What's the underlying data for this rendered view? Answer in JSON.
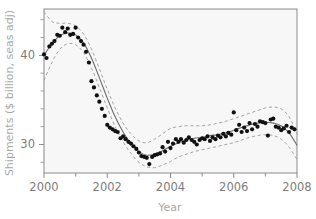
{
  "chart_data": {
    "type": "scatter",
    "title": "",
    "xlabel": "Year",
    "ylabel": "Shipments ($ billion, seas adj)",
    "xlim": [
      2000,
      2008
    ],
    "ylim": [
      26.8,
      45.2
    ],
    "grid": false,
    "legend": null,
    "xticks": [
      2000,
      2001,
      2002,
      2003,
      2004,
      2005,
      2006,
      2007,
      2008
    ],
    "xtick_labels": [
      "2000",
      "",
      "2002",
      "",
      "2004",
      "",
      "2006",
      "",
      "2008"
    ],
    "yticks": [
      28,
      30,
      32,
      34,
      36,
      38,
      40,
      42,
      44
    ],
    "ytick_labels": [
      "",
      "30",
      "",
      "",
      "",
      "",
      "40",
      "",
      ""
    ],
    "series": [
      {
        "name": "Observed shipments",
        "type": "scatter",
        "marker": "filled-circle",
        "color": "#111111",
        "x": [
          2000.0,
          2000.08,
          2000.17,
          2000.25,
          2000.33,
          2000.42,
          2000.5,
          2000.58,
          2000.67,
          2000.75,
          2000.83,
          2000.92,
          2001.0,
          2001.08,
          2001.17,
          2001.25,
          2001.33,
          2001.42,
          2001.5,
          2001.58,
          2001.67,
          2001.75,
          2001.83,
          2001.92,
          2002.0,
          2002.08,
          2002.17,
          2002.25,
          2002.33,
          2002.42,
          2002.5,
          2002.58,
          2002.67,
          2002.75,
          2002.83,
          2002.92,
          2003.0,
          2003.08,
          2003.17,
          2003.25,
          2003.33,
          2003.42,
          2003.5,
          2003.58,
          2003.67,
          2003.75,
          2003.83,
          2003.92,
          2004.0,
          2004.08,
          2004.17,
          2004.25,
          2004.33,
          2004.42,
          2004.5,
          2004.58,
          2004.67,
          2004.75,
          2004.83,
          2004.92,
          2005.0,
          2005.08,
          2005.17,
          2005.25,
          2005.33,
          2005.42,
          2005.5,
          2005.58,
          2005.67,
          2005.75,
          2005.83,
          2005.92,
          2006.0,
          2006.08,
          2006.17,
          2006.25,
          2006.33,
          2006.42,
          2006.5,
          2006.58,
          2006.67,
          2006.75,
          2006.83,
          2006.92,
          2007.0,
          2007.08,
          2007.17,
          2007.25,
          2007.33,
          2007.42,
          2007.5,
          2007.58,
          2007.67,
          2007.75,
          2007.83,
          2007.92
        ],
        "y": [
          40.1,
          39.7,
          41.0,
          41.3,
          41.6,
          42.3,
          42.2,
          43.1,
          42.6,
          43.0,
          42.3,
          42.4,
          43.1,
          42.0,
          41.6,
          41.2,
          40.4,
          39.2,
          37.1,
          36.4,
          35.5,
          34.8,
          34.0,
          33.2,
          32.2,
          31.9,
          31.7,
          31.5,
          31.4,
          30.7,
          30.9,
          30.6,
          30.3,
          30.1,
          29.8,
          29.5,
          29.1,
          28.7,
          28.6,
          28.5,
          27.8,
          28.6,
          28.8,
          28.9,
          29.0,
          29.7,
          29.2,
          30.3,
          29.6,
          30.1,
          30.6,
          30.3,
          30.6,
          30.2,
          30.5,
          30.8,
          30.5,
          30.3,
          30.0,
          30.5,
          30.7,
          30.6,
          30.9,
          30.4,
          30.8,
          30.6,
          31.0,
          30.8,
          31.2,
          30.9,
          31.3,
          31.1,
          33.6,
          31.6,
          32.2,
          31.4,
          31.9,
          31.5,
          32.4,
          31.7,
          32.3,
          32.0,
          32.6,
          32.5,
          32.4,
          31.0,
          32.8,
          32.9,
          32.0,
          31.9,
          31.6,
          31.8,
          32.1,
          31.4,
          31.9,
          31.7
        ]
      },
      {
        "name": "Fitted trend",
        "type": "line",
        "style": "solid",
        "color": "#6e6e6e",
        "x": [
          2000.0,
          2000.25,
          2000.5,
          2000.75,
          2001.0,
          2001.25,
          2001.5,
          2001.75,
          2002.0,
          2002.25,
          2002.5,
          2002.75,
          2003.0,
          2003.25,
          2003.5,
          2003.75,
          2004.0,
          2004.25,
          2004.5,
          2004.75,
          2005.0,
          2005.25,
          2005.5,
          2005.75,
          2006.0,
          2006.25,
          2006.5,
          2006.75,
          2007.0,
          2007.25,
          2007.5,
          2007.75,
          2008.0
        ],
        "y": [
          40.0,
          41.3,
          42.2,
          42.5,
          42.3,
          41.4,
          39.7,
          37.5,
          35.2,
          33.1,
          31.4,
          30.1,
          29.2,
          28.8,
          28.9,
          29.3,
          29.8,
          30.2,
          30.5,
          30.7,
          30.8,
          31.0,
          31.1,
          31.3,
          31.6,
          31.9,
          32.2,
          32.4,
          32.5,
          32.4,
          32.1,
          31.3,
          29.9
        ]
      },
      {
        "name": "Upper confidence band",
        "type": "line",
        "style": "dashed",
        "color": "#9b9b9b",
        "x": [
          2000.0,
          2000.25,
          2000.5,
          2000.75,
          2001.0,
          2001.25,
          2001.5,
          2001.75,
          2002.0,
          2002.25,
          2002.5,
          2002.75,
          2003.0,
          2003.25,
          2003.5,
          2003.75,
          2004.0,
          2004.25,
          2004.5,
          2004.75,
          2005.0,
          2005.25,
          2005.5,
          2005.75,
          2006.0,
          2006.25,
          2006.5,
          2006.75,
          2007.0,
          2007.25,
          2007.5,
          2007.75,
          2008.0
        ],
        "y": [
          44.9,
          43.8,
          43.6,
          43.6,
          43.3,
          42.4,
          40.7,
          38.5,
          36.2,
          34.1,
          32.4,
          31.2,
          30.4,
          30.2,
          30.6,
          31.2,
          31.8,
          32.0,
          32.1,
          32.1,
          32.1,
          32.2,
          32.4,
          32.6,
          32.9,
          33.2,
          33.5,
          33.8,
          34.1,
          34.2,
          34.0,
          33.1,
          31.2
        ]
      },
      {
        "name": "Lower confidence band",
        "type": "line",
        "style": "dashed",
        "color": "#9b9b9b",
        "x": [
          2000.0,
          2000.25,
          2000.5,
          2000.75,
          2001.0,
          2001.25,
          2001.5,
          2001.75,
          2002.0,
          2002.25,
          2002.5,
          2002.75,
          2003.0,
          2003.25,
          2003.5,
          2003.75,
          2004.0,
          2004.25,
          2004.5,
          2004.75,
          2005.0,
          2005.25,
          2005.5,
          2005.75,
          2006.0,
          2006.25,
          2006.5,
          2006.75,
          2007.0,
          2007.25,
          2007.5,
          2007.75,
          2008.0
        ],
        "y": [
          37.2,
          39.2,
          40.7,
          41.3,
          41.2,
          40.3,
          38.6,
          36.4,
          34.1,
          32.0,
          30.3,
          29.0,
          28.0,
          27.5,
          27.4,
          27.7,
          28.1,
          28.6,
          28.9,
          29.2,
          29.4,
          29.6,
          29.8,
          30.0,
          30.2,
          30.5,
          30.8,
          31.0,
          31.1,
          31.0,
          30.6,
          29.7,
          28.3
        ]
      }
    ],
    "colors": {
      "point": "#111111",
      "fit_line": "#6e6e6e",
      "band_line": "#9b9b9b",
      "frame": "#8a8a8a",
      "plot_background": "#f7f7f7",
      "tick_label": "#7d7d7d",
      "axis_title": "#a9a9a9"
    }
  }
}
